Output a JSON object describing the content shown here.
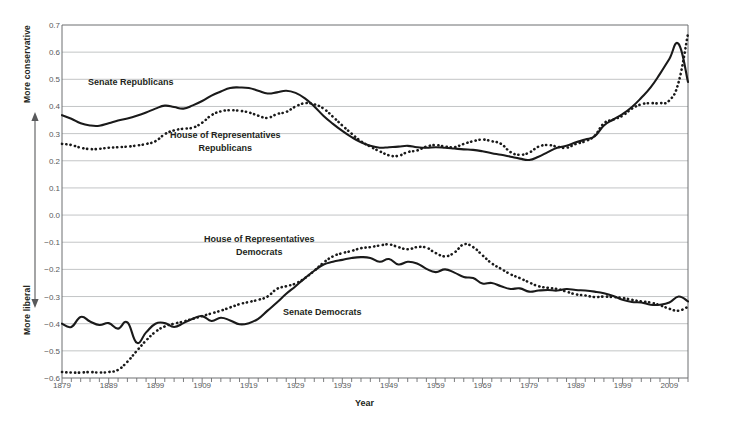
{
  "chart_data": {
    "type": "line",
    "title": "",
    "xlabel": "Year",
    "ylabel": "",
    "xlim": [
      1879,
      2013
    ],
    "ylim": [
      -0.6,
      0.7
    ],
    "grid": true,
    "legend_position": "inline-annotations",
    "y_axis_direction_top": "More conservative",
    "y_axis_direction_bottom": "More liberal",
    "ytick_labels": [
      "0.7",
      "0.6",
      "0.5",
      "0.4",
      "0.3",
      "0.2",
      "0.1",
      "0.0",
      "−0.1",
      "−0.2",
      "−0.3",
      "−0.4",
      "−0.5",
      "−0.6"
    ],
    "ytick_values": [
      0.7,
      0.6,
      0.5,
      0.4,
      0.3,
      0.2,
      0.1,
      0.0,
      -0.1,
      -0.2,
      -0.3,
      -0.4,
      -0.5,
      -0.6
    ],
    "xtick_labels": [
      "1879",
      "1889",
      "1899",
      "1909",
      "1919",
      "1929",
      "1939",
      "1949",
      "1959",
      "1969",
      "1979",
      "1989",
      "1999",
      "2009"
    ],
    "xtick_values": [
      1879,
      1889,
      1899,
      1909,
      1919,
      1929,
      1939,
      1949,
      1959,
      1969,
      1979,
      1989,
      1999,
      2009
    ],
    "minor_tick_interval": 2,
    "series": [
      {
        "name": "Senate Republicans",
        "style": "solid",
        "color": "#1a1a1a",
        "x": [
          1879,
          1881,
          1883,
          1885,
          1887,
          1889,
          1891,
          1893,
          1895,
          1897,
          1899,
          1901,
          1903,
          1905,
          1907,
          1909,
          1911,
          1913,
          1915,
          1917,
          1919,
          1921,
          1923,
          1925,
          1927,
          1929,
          1931,
          1933,
          1935,
          1937,
          1939,
          1941,
          1943,
          1945,
          1947,
          1949,
          1951,
          1953,
          1955,
          1957,
          1959,
          1961,
          1963,
          1965,
          1967,
          1969,
          1971,
          1973,
          1975,
          1977,
          1979,
          1981,
          1983,
          1985,
          1987,
          1989,
          1991,
          1993,
          1995,
          1997,
          1999,
          2001,
          2003,
          2005,
          2007,
          2009,
          2011,
          2013
        ],
        "y": [
          0.368,
          0.355,
          0.338,
          0.33,
          0.329,
          0.338,
          0.348,
          0.356,
          0.366,
          0.378,
          0.392,
          0.403,
          0.398,
          0.392,
          0.404,
          0.42,
          0.44,
          0.455,
          0.468,
          0.47,
          0.468,
          0.458,
          0.448,
          0.452,
          0.458,
          0.45,
          0.43,
          0.4,
          0.365,
          0.336,
          0.31,
          0.287,
          0.268,
          0.255,
          0.248,
          0.25,
          0.252,
          0.255,
          0.25,
          0.248,
          0.25,
          0.248,
          0.245,
          0.242,
          0.24,
          0.235,
          0.228,
          0.222,
          0.215,
          0.208,
          0.203,
          0.215,
          0.232,
          0.248,
          0.255,
          0.268,
          0.278,
          0.29,
          0.33,
          0.352,
          0.372,
          0.398,
          0.432,
          0.47,
          0.52,
          0.575,
          0.63,
          0.49
        ]
      },
      {
        "name": "House of Representatives Republicans",
        "style": "dotted",
        "color": "#1a1a1a",
        "x": [
          1879,
          1881,
          1883,
          1885,
          1887,
          1889,
          1891,
          1893,
          1895,
          1897,
          1899,
          1901,
          1903,
          1905,
          1907,
          1909,
          1911,
          1913,
          1915,
          1917,
          1919,
          1921,
          1923,
          1925,
          1927,
          1929,
          1931,
          1933,
          1935,
          1937,
          1939,
          1941,
          1943,
          1945,
          1947,
          1949,
          1951,
          1953,
          1955,
          1957,
          1959,
          1961,
          1963,
          1965,
          1967,
          1969,
          1971,
          1973,
          1975,
          1977,
          1979,
          1981,
          1983,
          1985,
          1987,
          1989,
          1991,
          1993,
          1995,
          1997,
          1999,
          2001,
          2003,
          2005,
          2007,
          2009,
          2011,
          2013
        ],
        "y": [
          0.262,
          0.258,
          0.248,
          0.243,
          0.244,
          0.248,
          0.25,
          0.252,
          0.256,
          0.262,
          0.272,
          0.298,
          0.312,
          0.318,
          0.322,
          0.34,
          0.368,
          0.382,
          0.386,
          0.384,
          0.378,
          0.366,
          0.358,
          0.372,
          0.38,
          0.4,
          0.412,
          0.408,
          0.392,
          0.362,
          0.33,
          0.3,
          0.272,
          0.252,
          0.235,
          0.22,
          0.218,
          0.232,
          0.238,
          0.252,
          0.258,
          0.252,
          0.25,
          0.262,
          0.272,
          0.278,
          0.272,
          0.262,
          0.232,
          0.222,
          0.23,
          0.252,
          0.258,
          0.252,
          0.248,
          0.262,
          0.272,
          0.292,
          0.338,
          0.352,
          0.366,
          0.392,
          0.408,
          0.412,
          0.412,
          0.422,
          0.49,
          0.668
        ]
      },
      {
        "name": "House of Representatives Democrats",
        "style": "dotted",
        "color": "#1a1a1a",
        "x": [
          1879,
          1881,
          1883,
          1885,
          1887,
          1889,
          1891,
          1893,
          1895,
          1897,
          1899,
          1901,
          1903,
          1905,
          1907,
          1909,
          1911,
          1913,
          1915,
          1917,
          1919,
          1921,
          1923,
          1925,
          1927,
          1929,
          1931,
          1933,
          1935,
          1937,
          1939,
          1941,
          1943,
          1945,
          1947,
          1949,
          1951,
          1953,
          1955,
          1957,
          1959,
          1961,
          1963,
          1965,
          1967,
          1969,
          1971,
          1973,
          1975,
          1977,
          1979,
          1981,
          1983,
          1985,
          1987,
          1989,
          1991,
          1993,
          1995,
          1997,
          1999,
          2001,
          2003,
          2005,
          2007,
          2009,
          2011,
          2013
        ],
        "y": [
          -0.578,
          -0.58,
          -0.58,
          -0.578,
          -0.58,
          -0.578,
          -0.57,
          -0.54,
          -0.5,
          -0.462,
          -0.43,
          -0.41,
          -0.4,
          -0.392,
          -0.382,
          -0.372,
          -0.362,
          -0.352,
          -0.34,
          -0.328,
          -0.32,
          -0.312,
          -0.3,
          -0.272,
          -0.262,
          -0.252,
          -0.232,
          -0.205,
          -0.175,
          -0.152,
          -0.14,
          -0.132,
          -0.122,
          -0.118,
          -0.112,
          -0.108,
          -0.118,
          -0.126,
          -0.118,
          -0.12,
          -0.14,
          -0.152,
          -0.138,
          -0.108,
          -0.118,
          -0.148,
          -0.178,
          -0.198,
          -0.218,
          -0.232,
          -0.248,
          -0.262,
          -0.268,
          -0.272,
          -0.282,
          -0.292,
          -0.296,
          -0.302,
          -0.3,
          -0.302,
          -0.305,
          -0.312,
          -0.318,
          -0.322,
          -0.332,
          -0.345,
          -0.352,
          -0.338
        ]
      },
      {
        "name": "Senate Democrats",
        "style": "solid",
        "color": "#1a1a1a",
        "x": [
          1879,
          1881,
          1883,
          1885,
          1887,
          1889,
          1891,
          1893,
          1895,
          1897,
          1899,
          1901,
          1903,
          1905,
          1907,
          1909,
          1911,
          1913,
          1915,
          1917,
          1919,
          1921,
          1923,
          1925,
          1927,
          1929,
          1931,
          1933,
          1935,
          1937,
          1939,
          1941,
          1943,
          1945,
          1947,
          1949,
          1951,
          1953,
          1955,
          1957,
          1959,
          1961,
          1963,
          1965,
          1967,
          1969,
          1971,
          1973,
          1975,
          1977,
          1979,
          1981,
          1983,
          1985,
          1987,
          1989,
          1991,
          1993,
          1995,
          1997,
          1999,
          2001,
          2003,
          2005,
          2007,
          2009,
          2011,
          2013
        ],
        "y": [
          -0.4,
          -0.412,
          -0.375,
          -0.392,
          -0.405,
          -0.398,
          -0.418,
          -0.395,
          -0.47,
          -0.432,
          -0.4,
          -0.398,
          -0.412,
          -0.398,
          -0.382,
          -0.372,
          -0.39,
          -0.378,
          -0.388,
          -0.402,
          -0.398,
          -0.382,
          -0.352,
          -0.322,
          -0.29,
          -0.262,
          -0.232,
          -0.205,
          -0.182,
          -0.172,
          -0.165,
          -0.158,
          -0.155,
          -0.158,
          -0.172,
          -0.162,
          -0.182,
          -0.172,
          -0.178,
          -0.198,
          -0.21,
          -0.2,
          -0.212,
          -0.228,
          -0.232,
          -0.252,
          -0.25,
          -0.262,
          -0.272,
          -0.27,
          -0.282,
          -0.278,
          -0.276,
          -0.278,
          -0.272,
          -0.276,
          -0.278,
          -0.282,
          -0.288,
          -0.298,
          -0.312,
          -0.32,
          -0.322,
          -0.33,
          -0.33,
          -0.322,
          -0.3,
          -0.318
        ]
      }
    ],
    "annotations": [
      {
        "id": "senate-republicans",
        "line1": "Senate Republicans",
        "line2": ""
      },
      {
        "id": "house-republicans",
        "line1": "House of Representatives",
        "line2": "Republicans"
      },
      {
        "id": "house-democrats",
        "line1": "House of Representatives",
        "line2": "Democrats"
      },
      {
        "id": "senate-democrats",
        "line1": "Senate Democrats",
        "line2": ""
      }
    ]
  },
  "axis": {
    "x_title": "Year",
    "direction_top": "More conservative",
    "direction_bottom": "More liberal"
  }
}
